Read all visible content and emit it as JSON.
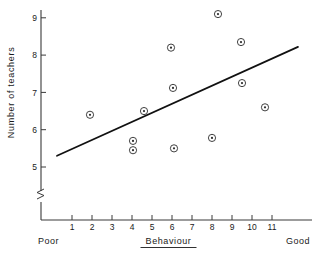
{
  "chart_data": {
    "type": "scatter",
    "title": "",
    "xlabel": "Behaviour",
    "ylabel": "Number of teachers",
    "x_low_label": "Poor",
    "x_high_label": "Good",
    "xticks": [
      "1",
      "2",
      "3",
      "4",
      "5",
      "6",
      "7",
      "8",
      "9",
      "10",
      "11"
    ],
    "yticks": [
      "5",
      "6",
      "7",
      "8",
      "9"
    ],
    "xlim": [
      0.2,
      12.4
    ],
    "ylim": [
      4.62,
      9.45
    ],
    "grid": false,
    "legend": null,
    "axis_break": "y-axis break below 5",
    "points": [
      {
        "x": 1.9,
        "y": 6.4
      },
      {
        "x": 4.05,
        "y": 5.7
      },
      {
        "x": 4.05,
        "y": 5.45
      },
      {
        "x": 4.6,
        "y": 6.5
      },
      {
        "x": 5.95,
        "y": 8.2
      },
      {
        "x": 6.05,
        "y": 7.12
      },
      {
        "x": 6.1,
        "y": 5.5
      },
      {
        "x": 8.0,
        "y": 5.78
      },
      {
        "x": 8.3,
        "y": 9.1
      },
      {
        "x": 9.45,
        "y": 8.35
      },
      {
        "x": 9.5,
        "y": 7.25
      },
      {
        "x": 10.65,
        "y": 6.6
      }
    ],
    "series": [
      {
        "name": "observations",
        "x": [
          1.9,
          4.05,
          4.05,
          4.6,
          5.95,
          6.05,
          6.1,
          8.0,
          8.3,
          9.45,
          9.5,
          10.65
        ],
        "values": [
          6.4,
          5.7,
          5.45,
          6.5,
          8.2,
          7.12,
          5.5,
          5.78,
          9.1,
          8.35,
          7.25,
          6.6
        ]
      }
    ],
    "fit_line": {
      "name": "regression line",
      "x_start": 0.25,
      "y_start": 5.3,
      "x_end": 12.3,
      "y_end": 8.22
    },
    "marker": "circle-with-center-dot",
    "colors": {
      "ink": "#1a1a1a",
      "axis": "#3a3a3a",
      "line": "#111111",
      "background": "#ffffff"
    }
  }
}
